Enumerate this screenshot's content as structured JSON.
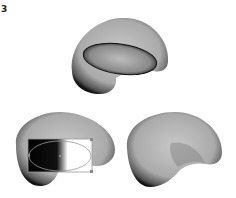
{
  "figure": {
    "step_number": "3",
    "panels": [
      {
        "id": "top",
        "description": "3D torus-like shape with inner ellipse hole"
      },
      {
        "id": "bottom-left",
        "description": "Shape with gradient-filled ellipse selection and bounding box"
      },
      {
        "id": "bottom-right",
        "description": "Shape with blended inner fold"
      }
    ]
  }
}
